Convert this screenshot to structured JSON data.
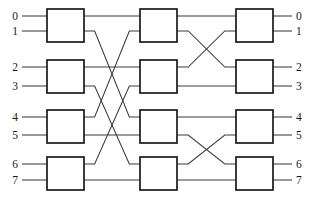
{
  "diagram": {
    "type": "interconnection-network",
    "title": "",
    "stage_count": 3,
    "switches_per_stage": 4,
    "terminal_count": 8,
    "colors": {
      "background": "#ffffff",
      "wire": "#3a3a3a",
      "box_stroke": "#1a1a1a",
      "box_fill": "#ffffff",
      "label": "#1a1a1a"
    },
    "inputs": [
      {
        "label": "0",
        "y": 16
      },
      {
        "label": "1",
        "y": 31
      },
      {
        "label": "2",
        "y": 67
      },
      {
        "label": "3",
        "y": 86
      },
      {
        "label": "4",
        "y": 117
      },
      {
        "label": "5",
        "y": 135
      },
      {
        "label": "6",
        "y": 164
      },
      {
        "label": "7",
        "y": 180
      }
    ],
    "outputs": [
      {
        "label": "0",
        "y": 16
      },
      {
        "label": "1",
        "y": 31
      },
      {
        "label": "2",
        "y": 67
      },
      {
        "label": "3",
        "y": 86
      },
      {
        "label": "4",
        "y": 117
      },
      {
        "label": "5",
        "y": 135
      },
      {
        "label": "6",
        "y": 164
      },
      {
        "label": "7",
        "y": 180
      }
    ],
    "switch_columns": [
      {
        "name": "stage-1",
        "x": 47,
        "width": 37
      },
      {
        "name": "stage-2",
        "x": 140,
        "width": 37
      },
      {
        "name": "stage-3",
        "x": 236,
        "width": 37
      }
    ],
    "switch_rows": [
      {
        "name": "row-0",
        "y": 9,
        "height": 33,
        "ports": [
          16,
          31
        ]
      },
      {
        "name": "row-1",
        "y": 60,
        "height": 33,
        "ports": [
          67,
          86
        ]
      },
      {
        "name": "row-2",
        "y": 110,
        "height": 33,
        "ports": [
          117,
          135
        ]
      },
      {
        "name": "row-3",
        "y": 157,
        "height": 33,
        "ports": [
          164,
          180
        ]
      }
    ],
    "input_stubs": [
      {
        "from_x": 22,
        "to_x": 47,
        "y": 16
      },
      {
        "from_x": 22,
        "to_x": 47,
        "y": 31
      },
      {
        "from_x": 22,
        "to_x": 47,
        "y": 67
      },
      {
        "from_x": 22,
        "to_x": 47,
        "y": 86
      },
      {
        "from_x": 22,
        "to_x": 47,
        "y": 117
      },
      {
        "from_x": 22,
        "to_x": 47,
        "y": 135
      },
      {
        "from_x": 22,
        "to_x": 47,
        "y": 164
      },
      {
        "from_x": 22,
        "to_x": 47,
        "y": 180
      }
    ],
    "output_stubs": [
      {
        "from_x": 273,
        "to_x": 292,
        "y": 16
      },
      {
        "from_x": 273,
        "to_x": 292,
        "y": 31
      },
      {
        "from_x": 273,
        "to_x": 292,
        "y": 67
      },
      {
        "from_x": 273,
        "to_x": 292,
        "y": 86
      },
      {
        "from_x": 273,
        "to_x": 292,
        "y": 117
      },
      {
        "from_x": 273,
        "to_x": 292,
        "y": 135
      },
      {
        "from_x": 273,
        "to_x": 292,
        "y": 164
      },
      {
        "from_x": 273,
        "to_x": 292,
        "y": 180
      }
    ],
    "links_stage1_to_stage2": [
      {
        "name": "s1-0-top-straight",
        "from_y": 16,
        "to_y": 16,
        "crossing": false
      },
      {
        "name": "s1-0-bot-to-s2-2-top",
        "from_y": 31,
        "to_y": 117,
        "crossing": true
      },
      {
        "name": "s1-1-top-straight",
        "from_y": 67,
        "to_y": 67,
        "crossing": false
      },
      {
        "name": "s1-1-bot-to-s2-3-top",
        "from_y": 86,
        "to_y": 164,
        "crossing": true
      },
      {
        "name": "s1-2-top-to-s2-0-bot",
        "from_y": 117,
        "to_y": 31,
        "crossing": true
      },
      {
        "name": "s1-2-bot-straight",
        "from_y": 135,
        "to_y": 135,
        "crossing": false
      },
      {
        "name": "s1-3-top-to-s2-1-bot",
        "from_y": 164,
        "to_y": 86,
        "crossing": true
      },
      {
        "name": "s1-3-bot-straight",
        "from_y": 180,
        "to_y": 180,
        "crossing": false
      }
    ],
    "links_stage2_to_stage3": [
      {
        "name": "s2-0-top-straight",
        "from_y": 16,
        "to_y": 16,
        "crossing": false
      },
      {
        "name": "s2-0-bot-to-s3-1-top",
        "from_y": 31,
        "to_y": 67,
        "crossing": true
      },
      {
        "name": "s2-1-top-to-s3-0-bot",
        "from_y": 67,
        "to_y": 31,
        "crossing": true
      },
      {
        "name": "s2-1-bot-straight",
        "from_y": 86,
        "to_y": 86,
        "crossing": false
      },
      {
        "name": "s2-2-top-straight",
        "from_y": 117,
        "to_y": 117,
        "crossing": false
      },
      {
        "name": "s2-2-bot-to-s3-3-top",
        "from_y": 135,
        "to_y": 164,
        "crossing": true
      },
      {
        "name": "s2-3-top-to-s3-2-bot",
        "from_y": 164,
        "to_y": 135,
        "crossing": true
      },
      {
        "name": "s2-3-bot-straight",
        "from_y": 180,
        "to_y": 180,
        "crossing": false
      }
    ],
    "label_positions": {
      "left_x": 18,
      "right_x": 296
    }
  }
}
